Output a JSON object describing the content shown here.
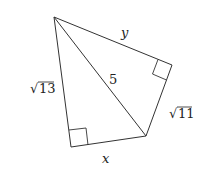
{
  "diagram": {
    "type": "geometry",
    "vertices": {
      "top": [
        54,
        17
      ],
      "right": [
        172,
        65
      ],
      "bottom_right": [
        146,
        136
      ],
      "bottom_left": [
        71,
        147
      ]
    },
    "edges": [
      {
        "from": "top",
        "to": "right",
        "label": "y"
      },
      {
        "from": "right",
        "to": "bottom_right",
        "label": "√11"
      },
      {
        "from": "bottom_right",
        "to": "bottom_left",
        "label": "x"
      },
      {
        "from": "bottom_left",
        "to": "top",
        "label": "√13"
      },
      {
        "from": "top",
        "to": "bottom_right",
        "label": "5",
        "kind": "diagonal"
      }
    ],
    "right_angles": [
      "right",
      "bottom_left"
    ],
    "labels": {
      "y": "y",
      "x": "x",
      "diag": "5",
      "left_radical": "√",
      "left_value": "13",
      "right_radical": "√",
      "right_value": "11"
    },
    "colors": {
      "line": "#333333",
      "text": "#222222",
      "background": "#ffffff"
    }
  }
}
